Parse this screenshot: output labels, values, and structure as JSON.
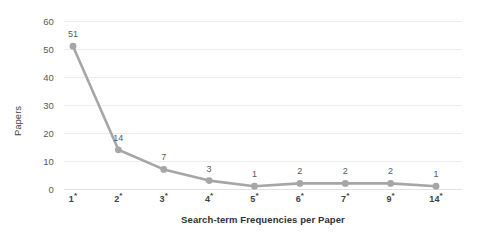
{
  "chart_data": {
    "type": "line",
    "title": "",
    "xlabel": "Search-term Frequencies per Paper",
    "ylabel": "Papers",
    "categories": [
      "1*",
      "2*",
      "3*",
      "4*",
      "5*",
      "6*",
      "7*",
      "9*",
      "14*"
    ],
    "values": [
      51,
      14,
      7,
      3,
      1,
      2,
      2,
      2,
      1
    ],
    "data_labels": [
      "51",
      "14",
      "7",
      "3",
      "1",
      "2",
      "2",
      "2",
      "1"
    ],
    "ylim": [
      0,
      60
    ],
    "ytick_labels": [
      "0",
      "10",
      "20",
      "30",
      "40",
      "50",
      "60"
    ],
    "ytick_values": [
      0,
      10,
      20,
      30,
      40,
      50,
      60
    ],
    "grid": "horizontal",
    "legend": "none",
    "series": [
      {
        "name": "Papers",
        "values": [
          51,
          14,
          7,
          3,
          1,
          2,
          2,
          2,
          1
        ],
        "line_color": "#a6a6a6",
        "marker_color": "#a6a6a6",
        "marker": "circle"
      }
    ],
    "colors": {
      "line": "#a6a6a6",
      "marker": "#a6a6a6",
      "gridline": "#eceff1",
      "baseline": "#e0e3e5",
      "text": "#58595b",
      "axis_title": "#2f3032",
      "background": "#ffffff"
    }
  }
}
